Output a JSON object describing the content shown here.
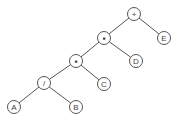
{
  "diagram": {
    "type": "expression-tree",
    "node_radius": 6.5,
    "colors": {
      "stroke": "#555555",
      "text": "#444444",
      "fill": "#ffffff"
    },
    "nodes": [
      {
        "id": "n_plus",
        "label": "+",
        "x": 134,
        "y": 14
      },
      {
        "id": "n_E",
        "label": "E",
        "x": 164,
        "y": 38
      },
      {
        "id": "n_mul1",
        "label": "•",
        "x": 104,
        "y": 38
      },
      {
        "id": "n_D",
        "label": "D",
        "x": 136,
        "y": 61
      },
      {
        "id": "n_mul2",
        "label": "•",
        "x": 76,
        "y": 61
      },
      {
        "id": "n_C",
        "label": "C",
        "x": 104,
        "y": 84
      },
      {
        "id": "n_div",
        "label": "/",
        "x": 44,
        "y": 83
      },
      {
        "id": "n_B",
        "label": "B",
        "x": 76,
        "y": 107
      },
      {
        "id": "n_A",
        "label": "A",
        "x": 14,
        "y": 107
      }
    ],
    "edges": [
      {
        "from": "n_plus",
        "to": "n_mul1"
      },
      {
        "from": "n_plus",
        "to": "n_E"
      },
      {
        "from": "n_mul1",
        "to": "n_mul2"
      },
      {
        "from": "n_mul1",
        "to": "n_D"
      },
      {
        "from": "n_mul2",
        "to": "n_div"
      },
      {
        "from": "n_mul2",
        "to": "n_C"
      },
      {
        "from": "n_div",
        "to": "n_A"
      },
      {
        "from": "n_div",
        "to": "n_B"
      }
    ]
  }
}
